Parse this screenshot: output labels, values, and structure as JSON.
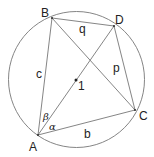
{
  "diagram": {
    "type": "inscribed-quadrilateral",
    "colors": {
      "line": "#777777",
      "text": "#222222",
      "background": "#ffffff"
    },
    "circle": {
      "cx": 76.5,
      "cy": 79.5,
      "r": 68
    },
    "center": {
      "x": 76,
      "y": 80,
      "label": "1"
    },
    "points": {
      "A": {
        "x": 38,
        "y": 135,
        "label": "A"
      },
      "B": {
        "x": 52,
        "y": 18,
        "label": "B"
      },
      "C": {
        "x": 135,
        "y": 110,
        "label": "C"
      },
      "D": {
        "x": 114,
        "y": 26,
        "label": "D"
      }
    },
    "sides": {
      "c": "c",
      "b": "b",
      "p": "p",
      "q": "q"
    },
    "angles": {
      "alpha": "α",
      "beta": "β"
    }
  }
}
